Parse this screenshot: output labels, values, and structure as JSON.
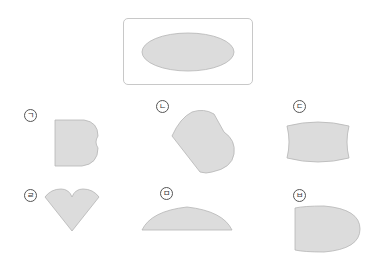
{
  "reference": {
    "shape": "ellipse",
    "fill": "#dcdcdc",
    "stroke": "#b5b5b5"
  },
  "options": [
    {
      "label": "ㄱ",
      "shape": "rectangle with double-bump right side"
    },
    {
      "label": "ㄴ",
      "shape": "tilted heart-like lobe shape"
    },
    {
      "label": "ㄷ",
      "shape": "barrel shape with curved top and bottom"
    },
    {
      "label": "ㄹ",
      "shape": "heart / cone shape"
    },
    {
      "label": "ㅁ",
      "shape": "half-ellipse segment"
    },
    {
      "label": "ㅂ",
      "shape": "bullet shape with rounded right side"
    }
  ]
}
